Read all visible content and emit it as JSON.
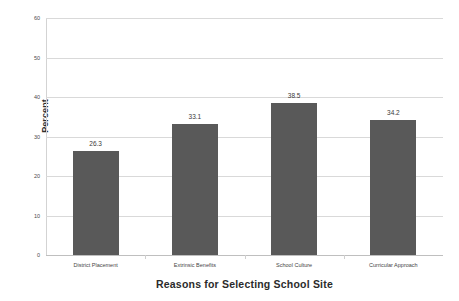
{
  "chart_data": {
    "type": "bar",
    "title": "",
    "xlabel": "Reasons for Selecting School Site",
    "ylabel": "Percent",
    "categories": [
      "District Placement",
      "Extrinsic Benefits",
      "School Culture",
      "Curricular Approach"
    ],
    "values": [
      26.3,
      33.1,
      38.5,
      34.2
    ],
    "value_labels": [
      "26.3",
      "33.1",
      "38.5",
      "34.2"
    ],
    "ylim": [
      0,
      60
    ],
    "yticks": [
      0,
      10,
      20,
      30,
      40,
      50,
      60
    ],
    "ytick_labels": [
      "0",
      "10",
      "20",
      "30",
      "40",
      "50",
      "60"
    ],
    "grid": "horizontal",
    "legend": "none",
    "bar_color": "#595959",
    "gridline_color": "#d9d9d9",
    "axis_color": "#bfbfbf",
    "background_color": "#ffffff"
  }
}
